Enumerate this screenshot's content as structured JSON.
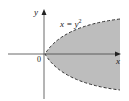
{
  "diagram": {
    "curve_label": "x = y",
    "curve_exponent": "2",
    "x_axis_label": "x",
    "y_axis_label": "y",
    "origin_label": "0",
    "colors": {
      "shade": "#bdbdbd",
      "curve": "#333333",
      "axis": "#444444"
    },
    "curve_style": "dashed",
    "region": "shaded interior of parabola opening right"
  }
}
